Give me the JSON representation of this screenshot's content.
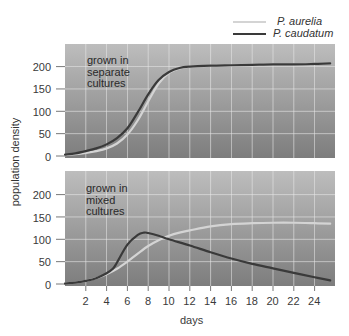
{
  "chart_data": [
    {
      "type": "line",
      "title": "grown in separate cultures",
      "annotation": [
        "grown in",
        "separate",
        "cultures"
      ],
      "xlabel": "days",
      "ylabel": "population density",
      "xlim": [
        0,
        26
      ],
      "ylim": [
        0,
        245
      ],
      "yticks": [
        0,
        50,
        100,
        150,
        200
      ],
      "grid": true,
      "series": [
        {
          "name": "P. aurelia",
          "color": "#d4d4d4",
          "x": [
            0,
            1,
            2,
            3,
            4,
            5,
            6,
            7,
            8,
            9,
            10,
            11,
            12,
            14,
            16,
            18,
            20,
            22,
            24,
            25.5
          ],
          "y": [
            2,
            4,
            7,
            11,
            17,
            28,
            48,
            80,
            122,
            162,
            186,
            196,
            200,
            202,
            203,
            204,
            205,
            205,
            206,
            207
          ]
        },
        {
          "name": "P. caudatum",
          "color": "#3a3a3a",
          "x": [
            0,
            1,
            2,
            3,
            4,
            5,
            6,
            7,
            8,
            9,
            10,
            11,
            12,
            14,
            16,
            18,
            20,
            22,
            24,
            25.5
          ],
          "y": [
            3,
            6,
            11,
            17,
            26,
            40,
            62,
            98,
            138,
            170,
            188,
            197,
            200,
            202,
            203,
            204,
            205,
            205,
            206,
            207
          ]
        }
      ]
    },
    {
      "type": "line",
      "title": "grown in mixed cultures",
      "annotation": [
        "grown in",
        "mixed",
        "cultures"
      ],
      "xlabel": "days",
      "ylabel": "population density",
      "xlim": [
        0,
        26
      ],
      "ylim": [
        0,
        245
      ],
      "xticks": [
        2,
        4,
        6,
        8,
        10,
        12,
        14,
        16,
        18,
        20,
        22,
        24
      ],
      "yticks": [
        0,
        50,
        100,
        150,
        200
      ],
      "grid": true,
      "series": [
        {
          "name": "P. aurelia",
          "color": "#d4d4d4",
          "x": [
            0,
            1,
            2,
            3,
            4,
            5,
            6,
            7,
            8,
            9,
            10,
            11,
            12,
            14,
            16,
            18,
            20,
            22,
            24,
            25.5
          ],
          "y": [
            1,
            3,
            7,
            13,
            22,
            34,
            50,
            68,
            85,
            98,
            108,
            115,
            120,
            129,
            134,
            136,
            137,
            137,
            136,
            135
          ]
        },
        {
          "name": "P. caudatum",
          "color": "#3a3a3a",
          "x": [
            0,
            1,
            2,
            3,
            4,
            4.6,
            5,
            6,
            7,
            7.6,
            8,
            9,
            10,
            12,
            14,
            16,
            18,
            20,
            22,
            24,
            25.5
          ],
          "y": [
            1,
            3,
            7,
            13,
            24,
            34,
            48,
            88,
            110,
            115,
            114,
            108,
            100,
            86,
            71,
            57,
            45,
            35,
            25,
            15,
            8
          ]
        }
      ]
    }
  ],
  "legend": {
    "items": [
      {
        "label": "P. aurelia",
        "color": "#d4d4d4"
      },
      {
        "label": "P. caudatum",
        "color": "#3a3a3a"
      }
    ]
  },
  "axes": {
    "ylabel": "population density",
    "xlabel": "days",
    "ytick_labels": [
      "0",
      "50",
      "100",
      "150",
      "200"
    ],
    "xtick_labels": [
      "2",
      "4",
      "6",
      "8",
      "10",
      "12",
      "14",
      "16",
      "18",
      "20",
      "22",
      "24"
    ]
  },
  "panels": [
    {
      "annotation": [
        "grown in",
        "separate",
        "cultures"
      ]
    },
    {
      "annotation": [
        "grown in",
        "mixed",
        "cultures"
      ]
    }
  ]
}
